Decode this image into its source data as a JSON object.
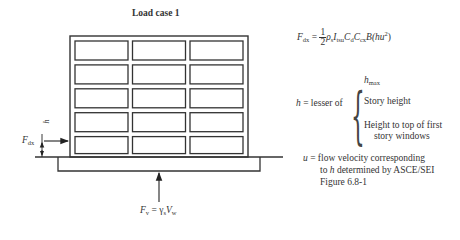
{
  "title": "Load case 1",
  "building": {
    "rows": 5,
    "cols": 3
  },
  "labels": {
    "fdx_left": "F",
    "fdx_left_sub": "dx",
    "h_dim": "h",
    "fv_base": "F",
    "fv_sub": "v",
    "fv_eq": " = γ",
    "fv_gamma_sub": "s",
    "fv_V": "V",
    "fv_V_sub": "w"
  },
  "equations": {
    "fdx": {
      "lhs": "F",
      "lhs_sub": "dx",
      "eq": " = ",
      "frac_num": "1",
      "frac_den": "2",
      "rho": "ρ",
      "rho_sub": "s",
      "I": "I",
      "I_sub": "tsu",
      "C1": "C",
      "C1_sub": "d",
      "C2": "C",
      "C2_sub": "cx",
      "B": "B",
      "paren": "(hu",
      "sup": "2",
      "close": ")"
    },
    "h": {
      "lhs": "h",
      "text": " = lesser of",
      "options": [
        "h",
        "Story height",
        "Height to top of first",
        "story windows"
      ],
      "hmax_sub": "max"
    },
    "u": {
      "lhs": "u",
      "line1": " = flow velocity corresponding",
      "line2_pre": "to ",
      "line2_h": "h",
      "line2_post": " determined by ASCE/SEI",
      "line3": "Figure 6.8-1"
    }
  }
}
